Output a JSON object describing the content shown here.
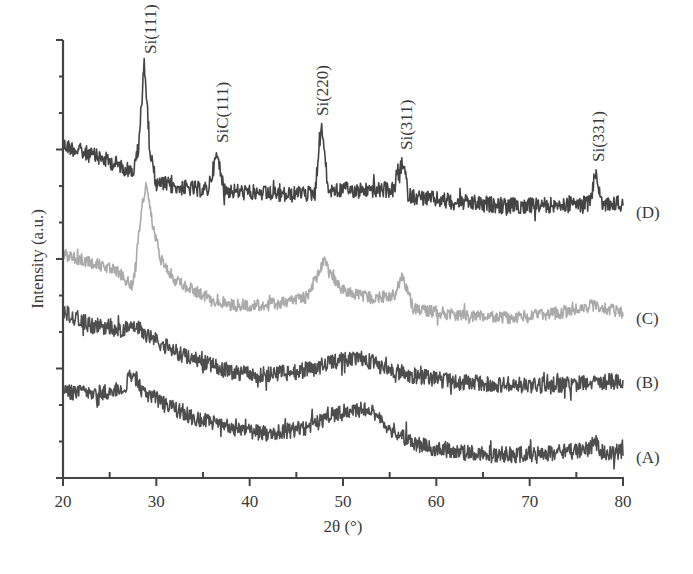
{
  "chart_data": {
    "type": "line",
    "title": "",
    "xlabel": "2θ (°)",
    "ylabel": "Intensity (a.u.)",
    "xlim": [
      20,
      80
    ],
    "x_ticks": [
      20,
      30,
      40,
      50,
      60,
      70,
      80
    ],
    "x_minor_step": 5,
    "y_ticks_count": 13,
    "y_tick_labels": [],
    "grid": false,
    "legend_position": "right, inline labels",
    "note": "Series are vertically offset XRD patterns; values are relative screen offsets (higher number = lower on chart), keypoints as [2theta, y_px].",
    "series": [
      {
        "name": "(D)",
        "color": "#3a3a3a",
        "label_y": 212,
        "keypoints": [
          [
            20,
            145
          ],
          [
            22,
            152
          ],
          [
            24,
            158
          ],
          [
            26,
            165
          ],
          [
            27.5,
            172
          ],
          [
            28.1,
            150
          ],
          [
            28.7,
            60
          ],
          [
            29.3,
            150
          ],
          [
            30,
            183
          ],
          [
            33,
            188
          ],
          [
            35.5,
            190
          ],
          [
            36.5,
            155
          ],
          [
            37.3,
            190
          ],
          [
            40,
            193
          ],
          [
            44,
            195
          ],
          [
            47,
            193
          ],
          [
            47.7,
            122
          ],
          [
            48.4,
            190
          ],
          [
            52,
            190
          ],
          [
            55.5,
            190
          ],
          [
            56.4,
            162
          ],
          [
            57.1,
            196
          ],
          [
            62,
            202
          ],
          [
            68,
            206
          ],
          [
            74,
            205
          ],
          [
            76.5,
            203
          ],
          [
            77.1,
            170
          ],
          [
            77.7,
            205
          ],
          [
            80,
            203
          ]
        ]
      },
      {
        "name": "(C)",
        "color": "#a5a5a5",
        "label_y": 318,
        "keypoints": [
          [
            20,
            255
          ],
          [
            23,
            262
          ],
          [
            26,
            272
          ],
          [
            27.5,
            288
          ],
          [
            28.4,
            210
          ],
          [
            28.9,
            185
          ],
          [
            29.6,
            225
          ],
          [
            30.5,
            258
          ],
          [
            32,
            280
          ],
          [
            35,
            295
          ],
          [
            38,
            305
          ],
          [
            42,
            305
          ],
          [
            46,
            298
          ],
          [
            47.3,
            275
          ],
          [
            47.9,
            260
          ],
          [
            48.6,
            275
          ],
          [
            50,
            290
          ],
          [
            53,
            298
          ],
          [
            55.5,
            295
          ],
          [
            56.4,
            276
          ],
          [
            57.5,
            308
          ],
          [
            62,
            315
          ],
          [
            68,
            318
          ],
          [
            74,
            312
          ],
          [
            77,
            305
          ],
          [
            80,
            313
          ]
        ]
      },
      {
        "name": "(B)",
        "color": "#454545",
        "label_y": 382,
        "keypoints": [
          [
            20,
            312
          ],
          [
            23,
            325
          ],
          [
            26,
            330
          ],
          [
            28,
            328
          ],
          [
            29.5,
            338
          ],
          [
            32,
            352
          ],
          [
            35,
            362
          ],
          [
            38,
            372
          ],
          [
            41,
            375
          ],
          [
            45,
            372
          ],
          [
            48,
            365
          ],
          [
            50,
            360
          ],
          [
            52,
            358
          ],
          [
            54,
            366
          ],
          [
            57,
            375
          ],
          [
            62,
            382
          ],
          [
            68,
            385
          ],
          [
            74,
            385
          ],
          [
            80,
            380
          ]
        ]
      },
      {
        "name": "(A)",
        "color": "#454545",
        "label_y": 457,
        "keypoints": [
          [
            20,
            392
          ],
          [
            24,
            393
          ],
          [
            26.5,
            388
          ],
          [
            27.5,
            372
          ],
          [
            28.5,
            392
          ],
          [
            31,
            405
          ],
          [
            34,
            418
          ],
          [
            38,
            428
          ],
          [
            42,
            434
          ],
          [
            46,
            428
          ],
          [
            49,
            415
          ],
          [
            51,
            410
          ],
          [
            53,
            410
          ],
          [
            55,
            428
          ],
          [
            58,
            445
          ],
          [
            62,
            452
          ],
          [
            68,
            455
          ],
          [
            74,
            452
          ],
          [
            76.5,
            448
          ],
          [
            77,
            440
          ],
          [
            77.5,
            452
          ],
          [
            80,
            452
          ]
        ]
      }
    ],
    "peak_annotations": [
      {
        "label": "Si(111)",
        "two_theta": 29.3,
        "y_bottom": 54
      },
      {
        "label": "SiC(111)",
        "two_theta": 37.0,
        "y_bottom": 143
      },
      {
        "label": "Si(220)",
        "two_theta": 47.8,
        "y_bottom": 116
      },
      {
        "label": "Si(311)",
        "two_theta": 56.7,
        "y_bottom": 150
      },
      {
        "label": "Si(331)",
        "two_theta": 77.3,
        "y_bottom": 162
      }
    ]
  },
  "axes": {
    "x_label": "2θ (°)",
    "y_label": "Intensity (a.u.)"
  }
}
